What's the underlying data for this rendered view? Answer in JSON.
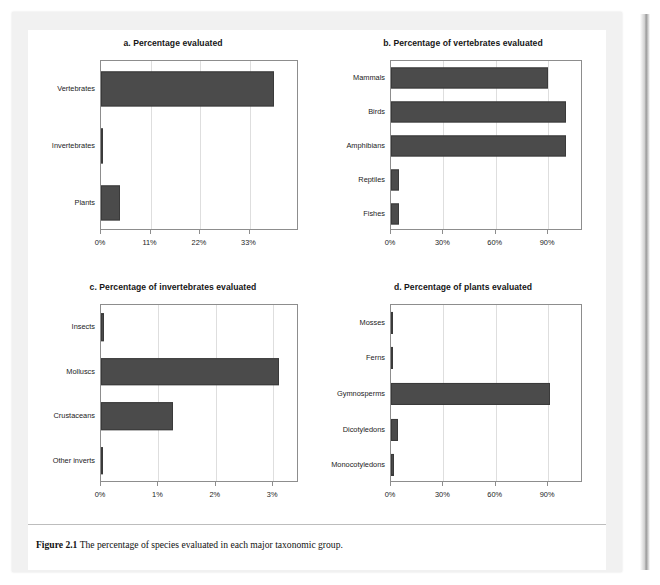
{
  "figure": {
    "caption_label": "Figure 2.1",
    "caption_text": "The percentage of species evaluated in each major taxonomic group."
  },
  "colors": {
    "bar_fill": "#4b4b4b",
    "bar_stroke": "#3a3a3a",
    "frame": "#8d8d8d",
    "gridline": "#dedede",
    "page_background": "#f1f1f1",
    "paper": "#ffffff"
  },
  "chart_data": [
    {
      "id": "a",
      "type": "bar",
      "orientation": "horizontal",
      "title": "a. Percentage evaluated",
      "categories": [
        "Vertebrates",
        "Invertebrates",
        "Plants"
      ],
      "values": [
        38.5,
        0.3,
        4.3
      ],
      "xlabel": "",
      "ylabel": "",
      "xlim": [
        0,
        44
      ],
      "xticks": [
        0,
        11,
        22,
        33
      ],
      "xtick_labels": [
        "0%",
        "11%",
        "22%",
        "33%"
      ],
      "grid": true,
      "legend": false
    },
    {
      "id": "b",
      "type": "bar",
      "orientation": "horizontal",
      "title": "b. Percentage of vertebrates evaluated",
      "categories": [
        "Mammals",
        "Birds",
        "Amphibians",
        "Reptiles",
        "Fishes"
      ],
      "values": [
        90.0,
        100.0,
        100.0,
        4.5,
        4.5
      ],
      "xlabel": "",
      "ylabel": "",
      "xlim": [
        0,
        110
      ],
      "xticks": [
        0,
        30,
        60,
        90
      ],
      "xtick_labels": [
        "0%",
        "30%",
        "60%",
        "90%"
      ],
      "grid": true,
      "legend": false
    },
    {
      "id": "c",
      "type": "bar",
      "orientation": "horizontal",
      "title": "c. Percentage of invertebrates evaluated",
      "categories": [
        "Insects",
        "Molluscs",
        "Crustaceans",
        "Other inverts"
      ],
      "values": [
        0.06,
        3.1,
        1.25,
        0.04
      ],
      "xlabel": "",
      "ylabel": "",
      "xlim": [
        0,
        3.45
      ],
      "xticks": [
        0,
        1,
        2,
        3
      ],
      "xtick_labels": [
        "0%",
        "1%",
        "2%",
        "3%"
      ],
      "grid": true,
      "legend": false
    },
    {
      "id": "d",
      "type": "bar",
      "orientation": "horizontal",
      "title": "d. Percentage of plants evaluated",
      "categories": [
        "Mosses",
        "Ferns",
        "Gymnosperms",
        "Dicotyledons",
        "Monocotyledons"
      ],
      "values": [
        0.3,
        1.1,
        91.0,
        4.0,
        1.6
      ],
      "xlabel": "",
      "ylabel": "",
      "xlim": [
        0,
        110
      ],
      "xticks": [
        0,
        30,
        60,
        90
      ],
      "xtick_labels": [
        "0%",
        "30%",
        "60%",
        "90%"
      ],
      "grid": true,
      "legend": false
    }
  ]
}
